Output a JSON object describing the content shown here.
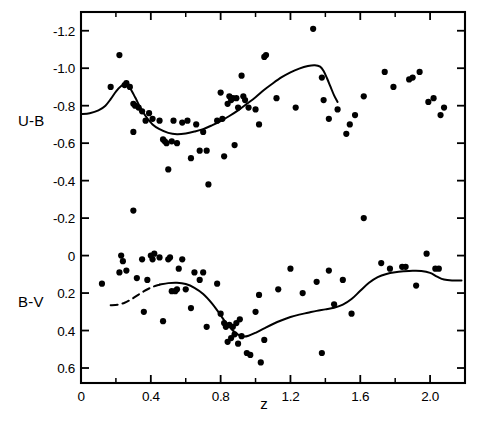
{
  "figure": {
    "background": "#ffffff",
    "ink": "#000000",
    "frame": {
      "left": 81,
      "right": 465,
      "top": 12,
      "bottom": 383
    },
    "corner_mark": ""
  },
  "chart_data": {
    "type": "scatter",
    "title": "",
    "subtitle": "",
    "xlabel": "z",
    "ylabel": "",
    "xlim": [
      0,
      2.2
    ],
    "ylim": [
      -1.3,
      0.68
    ],
    "y_inverted": true,
    "grid": false,
    "legend_position": "none",
    "xticks": [
      0,
      0.4,
      0.8,
      1.2,
      1.6,
      2.0
    ],
    "xticklabels": [
      "0",
      "0.4",
      "0.8",
      "1.2",
      "1.6",
      "2.0"
    ],
    "xminorticks": [
      0.2,
      0.6,
      1.0,
      1.4,
      1.8,
      2.2
    ],
    "yticks": [
      -1.2,
      -1.0,
      -0.8,
      -0.6,
      -0.4,
      -0.2,
      0,
      0.2,
      0.4,
      0.6
    ],
    "yticklabels": [
      "-1.2",
      "-1.0",
      "-0.8",
      "-0.6",
      "-0.4",
      "-0.2",
      "0",
      "0.2",
      "0.4",
      "0.6"
    ],
    "axis_names": [
      {
        "text": "U-B",
        "x": 0.0,
        "y": -0.72
      },
      {
        "text": "B-V",
        "x": 0.0,
        "y": 0.25
      }
    ],
    "series": [
      {
        "name": "U-B",
        "type": "scatter",
        "marker": "filled-circle",
        "color": "#000000",
        "points": [
          [
            0.17,
            -0.9
          ],
          [
            0.22,
            -1.07
          ],
          [
            0.25,
            -0.91
          ],
          [
            0.26,
            -0.92
          ],
          [
            0.28,
            -0.9
          ],
          [
            0.3,
            -0.81
          ],
          [
            0.31,
            -0.8
          ],
          [
            0.3,
            -0.66
          ],
          [
            0.33,
            -0.79
          ],
          [
            0.35,
            -0.77
          ],
          [
            0.37,
            -0.72
          ],
          [
            0.39,
            -0.76
          ],
          [
            0.41,
            -0.73
          ],
          [
            0.45,
            -0.72
          ],
          [
            0.47,
            -0.62
          ],
          [
            0.48,
            -0.61
          ],
          [
            0.49,
            -0.6
          ],
          [
            0.5,
            -0.46
          ],
          [
            0.52,
            -0.61
          ],
          [
            0.53,
            -0.72
          ],
          [
            0.55,
            -0.6
          ],
          [
            0.58,
            -0.71
          ],
          [
            0.61,
            -0.72
          ],
          [
            0.63,
            -0.52
          ],
          [
            0.66,
            -0.7
          ],
          [
            0.68,
            -0.56
          ],
          [
            0.7,
            -0.66
          ],
          [
            0.72,
            -0.56
          ],
          [
            0.73,
            -0.38
          ],
          [
            0.78,
            -0.72
          ],
          [
            0.8,
            -0.87
          ],
          [
            0.81,
            -0.73
          ],
          [
            0.82,
            -0.53
          ],
          [
            0.84,
            -0.81
          ],
          [
            0.85,
            -0.85
          ],
          [
            0.86,
            -0.83
          ],
          [
            0.87,
            -0.84
          ],
          [
            0.88,
            -0.59
          ],
          [
            0.89,
            -0.84
          ],
          [
            0.9,
            -0.79
          ],
          [
            0.92,
            -0.96
          ],
          [
            0.93,
            -0.85
          ],
          [
            0.94,
            -0.83
          ],
          [
            0.96,
            -0.79
          ],
          [
            1.0,
            -0.78
          ],
          [
            1.02,
            -0.7
          ],
          [
            1.05,
            -1.06
          ],
          [
            1.06,
            -1.07
          ],
          [
            1.12,
            -0.84
          ],
          [
            1.23,
            -0.79
          ],
          [
            1.33,
            -1.21
          ],
          [
            1.38,
            -0.95
          ],
          [
            1.39,
            -0.83
          ],
          [
            1.42,
            -0.73
          ],
          [
            1.47,
            -0.78
          ],
          [
            1.52,
            -0.65
          ],
          [
            1.54,
            -0.7
          ],
          [
            1.57,
            -0.75
          ],
          [
            1.62,
            -0.85
          ],
          [
            1.74,
            -0.98
          ],
          [
            1.79,
            -0.9
          ],
          [
            1.88,
            -0.94
          ],
          [
            1.9,
            -0.95
          ],
          [
            1.94,
            -0.98
          ],
          [
            1.99,
            -0.82
          ],
          [
            2.02,
            -0.84
          ],
          [
            2.06,
            -0.75
          ],
          [
            2.08,
            -0.79
          ]
        ]
      },
      {
        "name": "B-V",
        "type": "scatter",
        "marker": "filled-circle",
        "color": "#000000",
        "points": [
          [
            0.12,
            0.15
          ],
          [
            0.22,
            0.09
          ],
          [
            0.23,
            0.0
          ],
          [
            0.24,
            0.03
          ],
          [
            0.26,
            0.08
          ],
          [
            0.3,
            -0.24
          ],
          [
            0.32,
            0.12
          ],
          [
            0.35,
            0.02
          ],
          [
            0.36,
            0.3
          ],
          [
            0.38,
            0.13
          ],
          [
            0.4,
            0.0
          ],
          [
            0.41,
            0.02
          ],
          [
            0.42,
            -0.01
          ],
          [
            0.45,
            0.01
          ],
          [
            0.47,
            0.35
          ],
          [
            0.5,
            0.02
          ],
          [
            0.51,
            0.01
          ],
          [
            0.52,
            0.19
          ],
          [
            0.54,
            0.19
          ],
          [
            0.55,
            0.18
          ],
          [
            0.56,
            0.07
          ],
          [
            0.58,
            0.02
          ],
          [
            0.6,
            0.18
          ],
          [
            0.63,
            0.28
          ],
          [
            0.65,
            0.09
          ],
          [
            0.68,
            0.13
          ],
          [
            0.7,
            0.09
          ],
          [
            0.72,
            0.38
          ],
          [
            0.78,
            0.15
          ],
          [
            0.8,
            0.31
          ],
          [
            0.82,
            0.36
          ],
          [
            0.83,
            0.38
          ],
          [
            0.84,
            0.46
          ],
          [
            0.85,
            0.37
          ],
          [
            0.86,
            0.44
          ],
          [
            0.87,
            0.38
          ],
          [
            0.88,
            0.42
          ],
          [
            0.89,
            0.36
          ],
          [
            0.9,
            0.47
          ],
          [
            0.91,
            0.34
          ],
          [
            0.92,
            0.43
          ],
          [
            0.95,
            0.52
          ],
          [
            0.97,
            0.53
          ],
          [
            1.0,
            0.3
          ],
          [
            1.02,
            0.21
          ],
          [
            1.03,
            0.57
          ],
          [
            1.05,
            0.45
          ],
          [
            1.13,
            0.18
          ],
          [
            1.2,
            0.07
          ],
          [
            1.27,
            0.2
          ],
          [
            1.35,
            0.14
          ],
          [
            1.38,
            0.52
          ],
          [
            1.42,
            0.08
          ],
          [
            1.45,
            0.26
          ],
          [
            1.5,
            0.13
          ],
          [
            1.55,
            0.31
          ],
          [
            1.62,
            -0.2
          ],
          [
            1.72,
            0.04
          ],
          [
            1.77,
            0.07
          ],
          [
            1.84,
            0.06
          ],
          [
            1.86,
            0.06
          ],
          [
            1.92,
            0.16
          ],
          [
            1.98,
            -0.01
          ],
          [
            2.03,
            0.07
          ],
          [
            2.05,
            0.07
          ]
        ]
      },
      {
        "name": "U-B fit",
        "type": "line",
        "style": "solid",
        "color": "#000000",
        "path": [
          [
            0.0,
            -0.755
          ],
          [
            0.05,
            -0.76
          ],
          [
            0.1,
            -0.775
          ],
          [
            0.14,
            -0.8
          ],
          [
            0.17,
            -0.835
          ],
          [
            0.2,
            -0.875
          ],
          [
            0.23,
            -0.905
          ],
          [
            0.255,
            -0.915
          ],
          [
            0.28,
            -0.895
          ],
          [
            0.31,
            -0.845
          ],
          [
            0.34,
            -0.79
          ],
          [
            0.37,
            -0.745
          ],
          [
            0.41,
            -0.7
          ],
          [
            0.45,
            -0.675
          ],
          [
            0.5,
            -0.655
          ],
          [
            0.55,
            -0.648
          ],
          [
            0.6,
            -0.652
          ],
          [
            0.65,
            -0.662
          ],
          [
            0.7,
            -0.675
          ],
          [
            0.75,
            -0.695
          ],
          [
            0.8,
            -0.718
          ],
          [
            0.85,
            -0.745
          ],
          [
            0.9,
            -0.775
          ],
          [
            0.95,
            -0.81
          ],
          [
            1.0,
            -0.845
          ],
          [
            1.05,
            -0.885
          ],
          [
            1.1,
            -0.92
          ],
          [
            1.15,
            -0.952
          ],
          [
            1.2,
            -0.978
          ],
          [
            1.25,
            -0.998
          ],
          [
            1.3,
            -1.012
          ],
          [
            1.34,
            -1.016
          ],
          [
            1.37,
            -1.008
          ],
          [
            1.39,
            -0.985
          ],
          [
            1.41,
            -0.945
          ],
          [
            1.43,
            -0.9
          ],
          [
            1.45,
            -0.855
          ],
          [
            1.47,
            -0.82
          ]
        ]
      },
      {
        "name": "B-V fit dashed",
        "type": "line",
        "style": "dashed",
        "color": "#000000",
        "path": [
          [
            0.17,
            0.265
          ],
          [
            0.21,
            0.262
          ],
          [
            0.25,
            0.252
          ],
          [
            0.29,
            0.232
          ],
          [
            0.33,
            0.208
          ],
          [
            0.37,
            0.185
          ],
          [
            0.41,
            0.167
          ],
          [
            0.45,
            0.155
          ]
        ]
      },
      {
        "name": "B-V fit solid",
        "type": "line",
        "style": "solid",
        "color": "#000000",
        "path": [
          [
            0.45,
            0.155
          ],
          [
            0.5,
            0.147
          ],
          [
            0.55,
            0.145
          ],
          [
            0.6,
            0.152
          ],
          [
            0.65,
            0.172
          ],
          [
            0.7,
            0.205
          ],
          [
            0.75,
            0.255
          ],
          [
            0.79,
            0.305
          ],
          [
            0.83,
            0.358
          ],
          [
            0.87,
            0.4
          ],
          [
            0.9,
            0.422
          ],
          [
            0.93,
            0.432
          ],
          [
            0.96,
            0.428
          ],
          [
            1.0,
            0.412
          ],
          [
            1.05,
            0.388
          ],
          [
            1.1,
            0.365
          ],
          [
            1.15,
            0.345
          ],
          [
            1.2,
            0.328
          ],
          [
            1.25,
            0.315
          ],
          [
            1.3,
            0.305
          ],
          [
            1.35,
            0.295
          ],
          [
            1.4,
            0.287
          ],
          [
            1.45,
            0.278
          ],
          [
            1.5,
            0.262
          ],
          [
            1.55,
            0.232
          ],
          [
            1.6,
            0.188
          ],
          [
            1.65,
            0.145
          ],
          [
            1.7,
            0.115
          ],
          [
            1.75,
            0.098
          ],
          [
            1.8,
            0.089
          ],
          [
            1.85,
            0.084
          ],
          [
            1.9,
            0.081
          ],
          [
            1.95,
            0.082
          ],
          [
            2.0,
            0.092
          ],
          [
            2.04,
            0.112
          ],
          [
            2.08,
            0.128
          ],
          [
            2.13,
            0.133
          ],
          [
            2.18,
            0.133
          ]
        ]
      }
    ]
  }
}
